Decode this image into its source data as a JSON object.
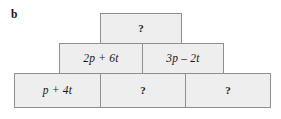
{
  "figure": {
    "label": "b",
    "type": "algebra-block-pyramid",
    "fill_color": "#eeeeee",
    "border_color": "#8f8f8f",
    "background_color": "#ffffff",
    "rows": [
      {
        "level": "top",
        "cells": [
          {
            "text": "?",
            "kind": "unknown"
          }
        ]
      },
      {
        "level": "middle",
        "cells": [
          {
            "text": "2p + 6t",
            "kind": "expression"
          },
          {
            "text": "3p – 2t",
            "kind": "expression"
          }
        ]
      },
      {
        "level": "bottom",
        "cells": [
          {
            "text": "p + 4t",
            "kind": "expression"
          },
          {
            "text": "?",
            "kind": "unknown"
          },
          {
            "text": "?",
            "kind": "unknown"
          }
        ]
      }
    ]
  }
}
